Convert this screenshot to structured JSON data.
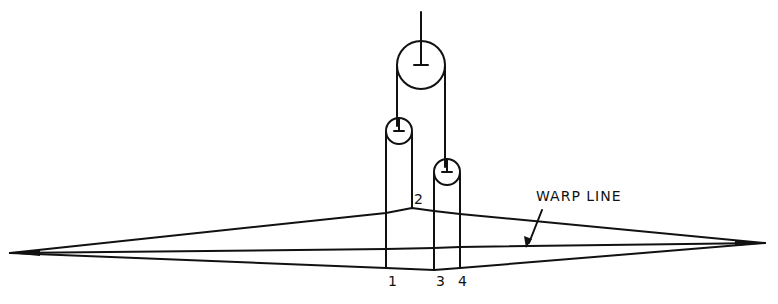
{
  "diagram": {
    "labels": {
      "warp_line": "WARP LINE",
      "point_1": "1",
      "point_2": "2",
      "point_3": "3",
      "point_4": "4"
    },
    "colors": {
      "stroke": "#111111",
      "background": "#ffffff"
    }
  }
}
